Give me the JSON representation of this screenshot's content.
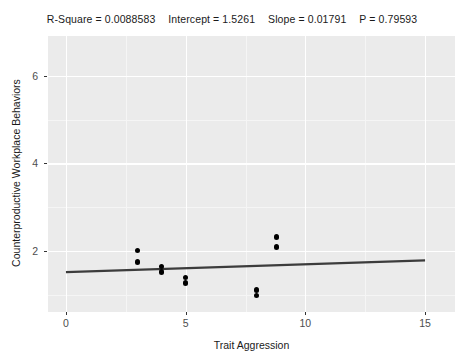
{
  "stats": {
    "r_square_label": "R-Square = 0.0088583",
    "intercept_label": "Intercept = 1.5261",
    "slope_label": "Slope = 0.01791",
    "p_label": "P = 0.79593"
  },
  "chart_data": {
    "type": "scatter",
    "xlabel": "Trait Aggression",
    "ylabel": "Counterproductive Workplace Behaviors",
    "xlim": [
      -0.75,
      16.25
    ],
    "ylim": [
      0.62,
      6.9
    ],
    "xticks": [
      0,
      5,
      10,
      15
    ],
    "yticks": [
      2,
      4,
      6
    ],
    "xtick_labels": [
      "0",
      "5",
      "10",
      "15"
    ],
    "ytick_labels": [
      "2",
      "4",
      "6"
    ],
    "grid": true,
    "legend": "none",
    "panel_background": "#ebebeb",
    "grid_color": "#ffffff",
    "point_color": "#000000",
    "line_color": "#3c3c3c",
    "points": [
      {
        "x": 3.0,
        "y": 2.02
      },
      {
        "x": 3.0,
        "y": 1.76
      },
      {
        "x": 4.0,
        "y": 1.66
      },
      {
        "x": 4.0,
        "y": 1.53
      },
      {
        "x": 5.0,
        "y": 1.4
      },
      {
        "x": 5.0,
        "y": 1.28
      },
      {
        "x": 7.95,
        "y": 1.12
      },
      {
        "x": 7.95,
        "y": 1.0
      },
      {
        "x": 8.8,
        "y": 2.33
      },
      {
        "x": 8.8,
        "y": 2.1
      }
    ],
    "fit_line": {
      "intercept": 1.5261,
      "slope": 0.01791,
      "x_start": 0,
      "x_end": 15,
      "y_start": 1.5261,
      "y_end": 1.7948
    },
    "r_square": 0.0088583,
    "p_value": 0.79593,
    "n": 10
  },
  "axis": {
    "x_title": "Trait Aggression",
    "y_title": "Counterproductive Workplace Behaviors"
  }
}
